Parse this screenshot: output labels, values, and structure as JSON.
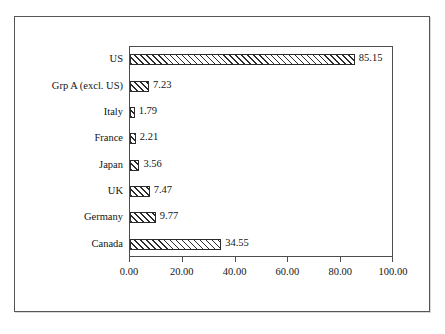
{
  "chart_data": {
    "type": "bar",
    "orientation": "horizontal",
    "title": "",
    "subtitle": "",
    "xlabel": "",
    "ylabel": "",
    "categories": [
      "US",
      "Grp A (excl. US)",
      "Italy",
      "France",
      "Japan",
      "UK",
      "Germany",
      "Canada"
    ],
    "values": [
      85.15,
      7.23,
      1.79,
      2.21,
      3.56,
      7.47,
      9.77,
      34.55
    ],
    "value_labels": [
      "85.15",
      "7.23",
      "1.79",
      "2.21",
      "3.56",
      "7.47",
      "9.77",
      "34.55"
    ],
    "xlim": [
      0,
      100
    ],
    "xticks": [
      0,
      20,
      40,
      60,
      80,
      100
    ],
    "xtick_labels": [
      "0.00",
      "20.00",
      "40.00",
      "60.00",
      "80.00",
      "100.00"
    ],
    "grid": false,
    "legend": null,
    "series": [
      {
        "name": "",
        "values": [
          85.15,
          7.23,
          1.79,
          2.21,
          3.56,
          7.47,
          9.77,
          34.55
        ],
        "fill": "diagonal-hatch",
        "fill_color": "#ffffff",
        "hatch_color": "#2b2b2b",
        "border_color": "#2b2b2b"
      }
    ],
    "colors": {
      "frame": "#555555",
      "axis": "#4d4d4d",
      "text": "#141414",
      "background": "#ffffff"
    }
  }
}
